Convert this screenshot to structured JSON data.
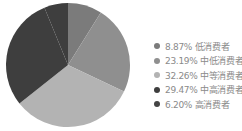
{
  "chart_data": {
    "type": "pie",
    "title": "",
    "categories": [
      "低消费者",
      "中低消费者",
      "中等消费者",
      "中高消费者",
      "高消费者"
    ],
    "values": [
      8.87,
      23.19,
      32.26,
      29.47,
      6.2
    ],
    "unit": "%",
    "start_angle": "12 o'clock",
    "direction": "clockwise",
    "colors": [
      "#7b7b7b",
      "#8f8f8f",
      "#b3b3b3",
      "#3e3e3e",
      "#3e3e3e"
    ],
    "legend_position": "right"
  },
  "legend": {
    "items": [
      {
        "label": "8.87% 低消费者",
        "color": "#7b7b7b"
      },
      {
        "label": "23.19% 中低消费者",
        "color": "#8f8f8f"
      },
      {
        "label": "32.26% 中等消费者",
        "color": "#b3b3b3"
      },
      {
        "label": "29.47% 中高消费者",
        "color": "#3e3e3e"
      },
      {
        "label": "6.20% 高消费者",
        "color": "#444444"
      }
    ]
  }
}
